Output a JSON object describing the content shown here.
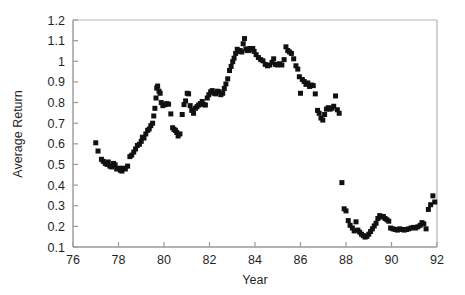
{
  "chart_data": {
    "type": "scatter",
    "title": "",
    "xlabel": "Year",
    "ylabel": "Average Return",
    "xlim": [
      76,
      92
    ],
    "ylim": [
      0.1,
      1.2
    ],
    "xticks": [
      76,
      78,
      80,
      82,
      84,
      86,
      88,
      90,
      92
    ],
    "xticklabels": [
      "76",
      "78",
      "80",
      "82",
      "84",
      "86",
      "88",
      "90",
      "92"
    ],
    "yticks": [
      0.1,
      0.2,
      0.3,
      0.4,
      0.5,
      0.6,
      0.7,
      0.8,
      0.9,
      1.0,
      1.1,
      1.2
    ],
    "yticklabels": [
      "0.1",
      "0.2",
      "0.3",
      "0.4",
      "0.5",
      "0.6",
      "0.7",
      "0.8",
      "0.9",
      "1",
      "1.1",
      "1.2"
    ],
    "grid": false,
    "legend": false,
    "marker": "filled-square",
    "marker_color": "#111111",
    "marker_size_px": 5,
    "series": [
      {
        "name": "Average Return",
        "points": [
          [
            77.0,
            0.605
          ],
          [
            77.1,
            0.565
          ],
          [
            77.25,
            0.525
          ],
          [
            77.33,
            0.515
          ],
          [
            77.42,
            0.505
          ],
          [
            77.5,
            0.5
          ],
          [
            77.55,
            0.512
          ],
          [
            77.62,
            0.492
          ],
          [
            77.7,
            0.488
          ],
          [
            77.78,
            0.505
          ],
          [
            77.85,
            0.498
          ],
          [
            77.92,
            0.478
          ],
          [
            78.0,
            0.482
          ],
          [
            78.08,
            0.472
          ],
          [
            78.15,
            0.468
          ],
          [
            78.22,
            0.482
          ],
          [
            78.3,
            0.478
          ],
          [
            78.4,
            0.492
          ],
          [
            78.5,
            0.538
          ],
          [
            78.58,
            0.545
          ],
          [
            78.67,
            0.56
          ],
          [
            78.75,
            0.575
          ],
          [
            78.83,
            0.592
          ],
          [
            78.92,
            0.598
          ],
          [
            79.0,
            0.612
          ],
          [
            79.05,
            0.632
          ],
          [
            79.12,
            0.628
          ],
          [
            79.2,
            0.648
          ],
          [
            79.28,
            0.665
          ],
          [
            79.35,
            0.672
          ],
          [
            79.42,
            0.688
          ],
          [
            79.5,
            0.7
          ],
          [
            79.55,
            0.735
          ],
          [
            79.6,
            0.772
          ],
          [
            79.65,
            0.822
          ],
          [
            79.68,
            0.87
          ],
          [
            79.72,
            0.88
          ],
          [
            79.78,
            0.855
          ],
          [
            79.83,
            0.845
          ],
          [
            79.88,
            0.8
          ],
          [
            79.95,
            0.785
          ],
          [
            80.05,
            0.79
          ],
          [
            80.12,
            0.795
          ],
          [
            80.2,
            0.792
          ],
          [
            80.3,
            0.745
          ],
          [
            80.38,
            0.678
          ],
          [
            80.44,
            0.67
          ],
          [
            80.5,
            0.665
          ],
          [
            80.56,
            0.655
          ],
          [
            80.62,
            0.638
          ],
          [
            80.7,
            0.648
          ],
          [
            80.8,
            0.742
          ],
          [
            80.88,
            0.79
          ],
          [
            80.95,
            0.808
          ],
          [
            81.02,
            0.845
          ],
          [
            81.08,
            0.842
          ],
          [
            81.15,
            0.785
          ],
          [
            81.22,
            0.762
          ],
          [
            81.3,
            0.748
          ],
          [
            81.38,
            0.772
          ],
          [
            81.45,
            0.78
          ],
          [
            81.52,
            0.788
          ],
          [
            81.6,
            0.795
          ],
          [
            81.68,
            0.805
          ],
          [
            81.75,
            0.79
          ],
          [
            81.82,
            0.788
          ],
          [
            81.9,
            0.822
          ],
          [
            81.97,
            0.838
          ],
          [
            82.05,
            0.852
          ],
          [
            82.12,
            0.858
          ],
          [
            82.2,
            0.845
          ],
          [
            82.28,
            0.842
          ],
          [
            82.35,
            0.855
          ],
          [
            82.42,
            0.852
          ],
          [
            82.5,
            0.838
          ],
          [
            82.58,
            0.845
          ],
          [
            82.65,
            0.868
          ],
          [
            82.72,
            0.89
          ],
          [
            82.8,
            0.915
          ],
          [
            82.88,
            0.955
          ],
          [
            82.95,
            0.975
          ],
          [
            83.02,
            0.998
          ],
          [
            83.08,
            1.015
          ],
          [
            83.15,
            1.038
          ],
          [
            83.22,
            1.058
          ],
          [
            83.28,
            1.048
          ],
          [
            83.35,
            1.052
          ],
          [
            83.42,
            1.045
          ],
          [
            83.48,
            1.085
          ],
          [
            83.54,
            1.11
          ],
          [
            83.6,
            1.06
          ],
          [
            83.66,
            1.052
          ],
          [
            83.72,
            1.052
          ],
          [
            83.78,
            1.062
          ],
          [
            83.84,
            1.058
          ],
          [
            83.9,
            1.062
          ],
          [
            83.96,
            1.048
          ],
          [
            84.05,
            1.032
          ],
          [
            84.15,
            1.018
          ],
          [
            84.25,
            1.008
          ],
          [
            84.35,
            1.002
          ],
          [
            84.45,
            0.985
          ],
          [
            84.55,
            0.978
          ],
          [
            84.65,
            0.982
          ],
          [
            84.75,
            0.995
          ],
          [
            84.82,
            1.012
          ],
          [
            84.9,
            0.985
          ],
          [
            84.98,
            0.982
          ],
          [
            85.08,
            0.988
          ],
          [
            85.18,
            0.982
          ],
          [
            85.28,
            1.008
          ],
          [
            85.36,
            1.07
          ],
          [
            85.44,
            1.052
          ],
          [
            85.52,
            1.045
          ],
          [
            85.6,
            1.038
          ],
          [
            85.7,
            1.012
          ],
          [
            85.8,
            0.978
          ],
          [
            85.88,
            0.962
          ],
          [
            85.95,
            0.925
          ],
          [
            86.0,
            0.845
          ],
          [
            86.08,
            0.912
          ],
          [
            86.16,
            0.902
          ],
          [
            86.24,
            0.888
          ],
          [
            86.32,
            0.895
          ],
          [
            86.4,
            0.878
          ],
          [
            86.48,
            0.885
          ],
          [
            86.56,
            0.882
          ],
          [
            86.65,
            0.842
          ],
          [
            86.75,
            0.762
          ],
          [
            86.82,
            0.748
          ],
          [
            86.9,
            0.725
          ],
          [
            86.98,
            0.715
          ],
          [
            87.06,
            0.742
          ],
          [
            87.14,
            0.768
          ],
          [
            87.22,
            0.775
          ],
          [
            87.3,
            0.768
          ],
          [
            87.38,
            0.772
          ],
          [
            87.46,
            0.782
          ],
          [
            87.54,
            0.832
          ],
          [
            87.62,
            0.765
          ],
          [
            87.7,
            0.748
          ],
          [
            87.82,
            0.412
          ],
          [
            87.92,
            0.285
          ],
          [
            88.0,
            0.275
          ],
          [
            88.1,
            0.228
          ],
          [
            88.18,
            0.205
          ],
          [
            88.28,
            0.192
          ],
          [
            88.36,
            0.178
          ],
          [
            88.44,
            0.222
          ],
          [
            88.52,
            0.182
          ],
          [
            88.6,
            0.172
          ],
          [
            88.68,
            0.162
          ],
          [
            88.76,
            0.155
          ],
          [
            88.84,
            0.148
          ],
          [
            88.92,
            0.152
          ],
          [
            89.0,
            0.162
          ],
          [
            89.08,
            0.175
          ],
          [
            89.16,
            0.188
          ],
          [
            89.24,
            0.202
          ],
          [
            89.32,
            0.215
          ],
          [
            89.4,
            0.238
          ],
          [
            89.48,
            0.252
          ],
          [
            89.56,
            0.245
          ],
          [
            89.64,
            0.248
          ],
          [
            89.72,
            0.238
          ],
          [
            89.8,
            0.232
          ],
          [
            89.88,
            0.225
          ],
          [
            89.96,
            0.192
          ],
          [
            90.06,
            0.188
          ],
          [
            90.16,
            0.185
          ],
          [
            90.26,
            0.182
          ],
          [
            90.36,
            0.188
          ],
          [
            90.46,
            0.185
          ],
          [
            90.56,
            0.182
          ],
          [
            90.66,
            0.185
          ],
          [
            90.76,
            0.188
          ],
          [
            90.86,
            0.192
          ],
          [
            90.96,
            0.195
          ],
          [
            91.06,
            0.192
          ],
          [
            91.16,
            0.198
          ],
          [
            91.26,
            0.205
          ],
          [
            91.34,
            0.218
          ],
          [
            91.42,
            0.212
          ],
          [
            91.52,
            0.188
          ],
          [
            91.62,
            0.282
          ],
          [
            91.72,
            0.305
          ],
          [
            91.82,
            0.348
          ],
          [
            91.9,
            0.318
          ]
        ]
      }
    ]
  },
  "axes": {
    "y_title": "Average Return",
    "x_title": "Year"
  }
}
